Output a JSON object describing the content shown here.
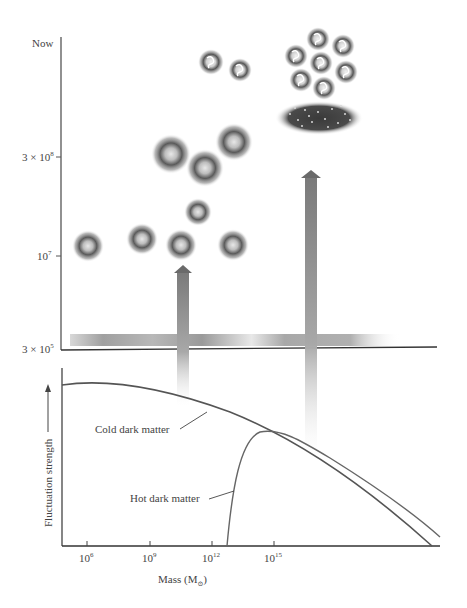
{
  "upper_panel": {
    "y_axis": {
      "ticks": [
        {
          "label": "Now",
          "y": 44
        },
        {
          "label_base": "3 × 10",
          "label_exp": "8",
          "y": 157
        },
        {
          "label_base": "10",
          "label_exp": "7",
          "y": 256
        },
        {
          "label_base": "3 × 10",
          "label_exp": "5",
          "y": 349
        }
      ]
    },
    "objects": {
      "small_clouds": [
        {
          "cx": 88,
          "cy": 246,
          "r": 15
        },
        {
          "cx": 142,
          "cy": 239,
          "r": 15
        },
        {
          "cx": 181,
          "cy": 245,
          "r": 15
        },
        {
          "cx": 198,
          "cy": 212,
          "r": 13
        },
        {
          "cx": 233,
          "cy": 245,
          "r": 15
        }
      ],
      "large_clouds": [
        {
          "cx": 171,
          "cy": 154,
          "r": 19
        },
        {
          "cx": 205,
          "cy": 168,
          "r": 18
        },
        {
          "cx": 234,
          "cy": 142,
          "r": 18
        }
      ],
      "galaxies": [
        {
          "cx": 211,
          "cy": 62,
          "r": 12
        },
        {
          "cx": 240,
          "cy": 70,
          "r": 11
        }
      ],
      "galaxy_group": [
        {
          "cx": 318,
          "cy": 39,
          "r": 11
        },
        {
          "cx": 343,
          "cy": 46,
          "r": 11
        },
        {
          "cx": 296,
          "cy": 56,
          "r": 11
        },
        {
          "cx": 321,
          "cy": 63,
          "r": 11
        },
        {
          "cx": 346,
          "cy": 72,
          "r": 11
        },
        {
          "cx": 301,
          "cy": 80,
          "r": 11
        },
        {
          "cx": 324,
          "cy": 88,
          "r": 11
        }
      ],
      "supercluster_sheet": {
        "cx": 319,
        "cy": 118,
        "rx": 40,
        "ry": 15
      }
    },
    "arrows": [
      {
        "x": 183,
        "tip_y": 266,
        "tail_y": 405
      },
      {
        "x": 311,
        "tip_y": 171,
        "tail_y": 455
      }
    ],
    "horizontal_band_y": 340
  },
  "lower_panel": {
    "y_axis_label": "Fluctuation strength",
    "x_axis_label": "Mass (M",
    "x_axis_label_sub": "⊙",
    "x_axis_label_close": ")",
    "x_ticks": [
      {
        "label_base": "10",
        "label_exp": "6",
        "x": 87
      },
      {
        "label_base": "10",
        "label_exp": "9",
        "x": 150
      },
      {
        "label_base": "10",
        "label_exp": "12",
        "x": 212
      },
      {
        "label_base": "10",
        "label_exp": "15",
        "x": 274
      }
    ],
    "curves": {
      "cold": "Cold dark matter",
      "hot": "Hot dark matter"
    }
  }
}
